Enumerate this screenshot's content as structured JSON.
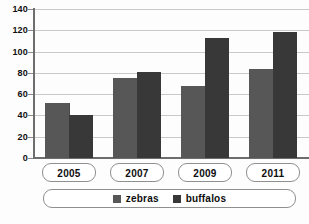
{
  "chart_data": {
    "type": "bar",
    "title": "",
    "subtitle": "",
    "xlabel": "",
    "ylabel": "",
    "categories": [
      "2005",
      "2007",
      "2009",
      "2011"
    ],
    "series": [
      {
        "name": "zebras",
        "color": "#575757",
        "values": [
          52,
          75,
          68,
          84
        ]
      },
      {
        "name": "buffalos",
        "color": "#383838",
        "values": [
          40,
          81,
          113,
          118
        ]
      }
    ],
    "ylim": [
      0,
      140
    ],
    "ytick_step": 20,
    "yticks": [
      0,
      20,
      40,
      60,
      80,
      100,
      120,
      140
    ],
    "ytick_labels": [
      "0",
      "20",
      "40",
      "60",
      "80",
      "100",
      "120",
      "140"
    ],
    "grid": true,
    "grid_axis": "y",
    "legend_position": "bottom",
    "legend_entries": [
      "zebras",
      "buffalos"
    ],
    "background": "#ffffff",
    "axis_color": "#6d6d6d",
    "grid_color": "#c9c9c9"
  }
}
